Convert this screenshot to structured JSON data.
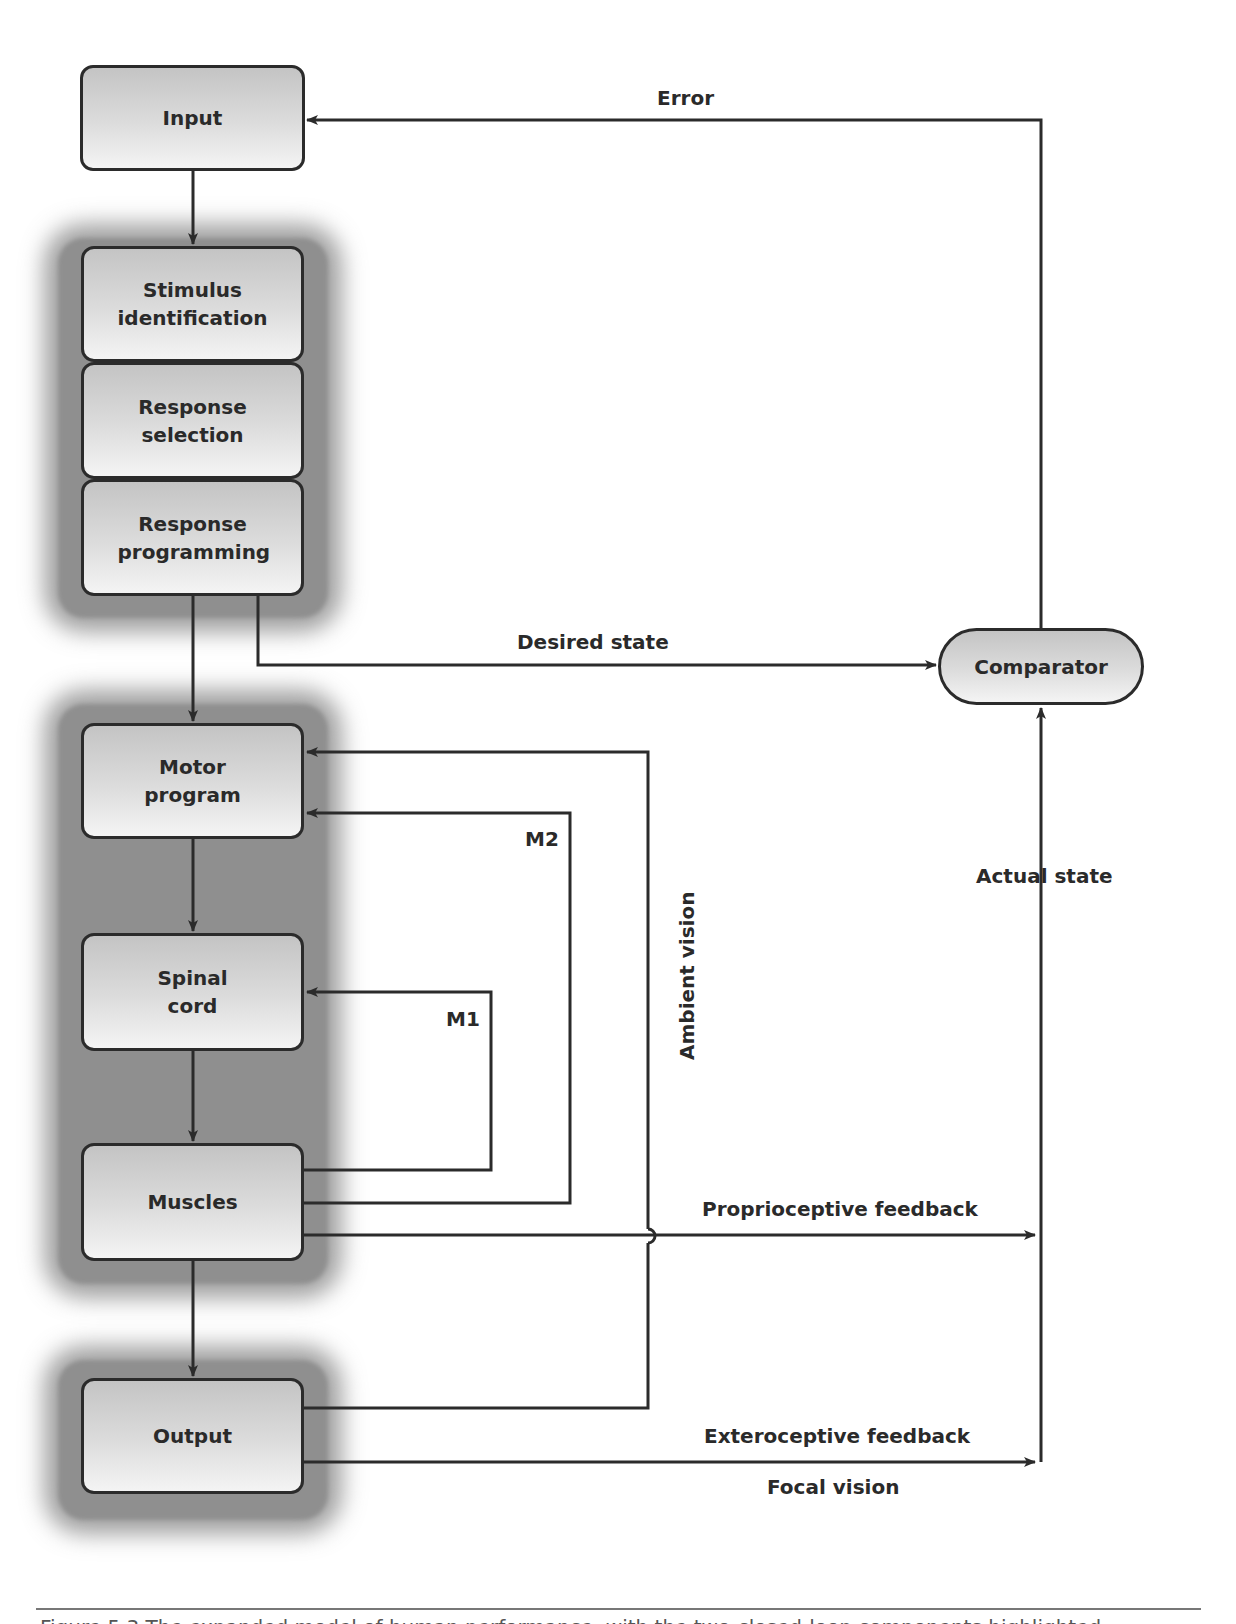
{
  "diagram": {
    "type": "flowchart",
    "nodes": {
      "input": "Input",
      "stimulus_identification": "Stimulus identification",
      "response_selection": "Response selection",
      "response_programming": "Response programming",
      "motor_program": "Motor program",
      "spinal_cord": "Spinal cord",
      "muscles": "Muscles",
      "output": "Output",
      "comparator": "Comparator"
    },
    "edge_labels": {
      "error": "Error",
      "desired_state": "Desired state",
      "actual_state": "Actual state",
      "m1": "M1",
      "m2": "M2",
      "ambient_vision": "Ambient vision",
      "proprioceptive_feedback": "Proprioceptive feedback",
      "exteroceptive_feedback": "Exteroceptive feedback",
      "focal_vision": "Focal vision"
    },
    "edges": [
      {
        "from": "Input",
        "to": "Stimulus identification"
      },
      {
        "from": "Response programming",
        "to": "Motor program"
      },
      {
        "from": "Response programming",
        "to": "Comparator",
        "label": "Desired state"
      },
      {
        "from": "Comparator",
        "to": "Input",
        "label": "Error"
      },
      {
        "from": "Motor program",
        "to": "Spinal cord"
      },
      {
        "from": "Spinal cord",
        "to": "Muscles"
      },
      {
        "from": "Muscles",
        "to": "Output"
      },
      {
        "from": "Muscles",
        "to": "Spinal cord",
        "label": "M1"
      },
      {
        "from": "Muscles",
        "to": "Motor program",
        "label": "M2"
      },
      {
        "from": "Output",
        "to": "Motor program",
        "label": "Ambient vision"
      },
      {
        "from": "Muscles",
        "to": "Comparator",
        "label": "Proprioceptive feedback"
      },
      {
        "from": "Output",
        "to": "Comparator",
        "label": "Exteroceptive feedback / Focal vision"
      },
      {
        "from": "feedback",
        "to": "Comparator",
        "label": "Actual state"
      }
    ],
    "colors": {
      "line": "#2b2b2b",
      "box_top": "#c4c4c4",
      "box_bottom": "#f4f4f4",
      "shade": "#8f8f8f"
    }
  },
  "caption": {
    "text": "Figure 5.3   The expanded model of human performance, with the two-closed-loop components highlighted."
  }
}
